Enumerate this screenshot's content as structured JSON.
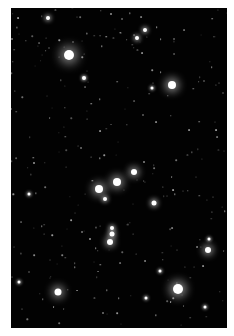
{
  "image": {
    "subject": "star field",
    "frame": {
      "left": 11,
      "top": 8,
      "width": 216,
      "height": 320,
      "background": "#020202",
      "border": "#ffffff"
    },
    "bright_stars": [
      {
        "x": 69,
        "y": 55,
        "r": 5,
        "glow": 11
      },
      {
        "x": 172,
        "y": 85,
        "r": 4,
        "glow": 9
      },
      {
        "x": 117,
        "y": 182,
        "r": 4,
        "glow": 8
      },
      {
        "x": 99,
        "y": 189,
        "r": 4,
        "glow": 8
      },
      {
        "x": 134,
        "y": 172,
        "r": 3,
        "glow": 7
      },
      {
        "x": 178,
        "y": 289,
        "r": 5,
        "glow": 10
      },
      {
        "x": 58,
        "y": 292,
        "r": 3.5,
        "glow": 8
      },
      {
        "x": 208,
        "y": 250,
        "r": 3,
        "glow": 7
      },
      {
        "x": 110,
        "y": 242,
        "r": 3,
        "glow": 6
      },
      {
        "x": 112,
        "y": 234,
        "r": 2.5,
        "glow": 5
      },
      {
        "x": 112,
        "y": 228,
        "r": 2,
        "glow": 4
      },
      {
        "x": 154,
        "y": 203,
        "r": 2.5,
        "glow": 5
      },
      {
        "x": 105,
        "y": 199,
        "r": 2,
        "glow": 4
      },
      {
        "x": 48,
        "y": 18,
        "r": 2,
        "glow": 4
      },
      {
        "x": 137,
        "y": 38,
        "r": 2,
        "glow": 4
      },
      {
        "x": 145,
        "y": 30,
        "r": 2,
        "glow": 4
      },
      {
        "x": 84,
        "y": 78,
        "r": 2,
        "glow": 3
      },
      {
        "x": 152,
        "y": 88,
        "r": 1.5,
        "glow": 3
      },
      {
        "x": 205,
        "y": 307,
        "r": 1.5,
        "glow": 3
      },
      {
        "x": 146,
        "y": 298,
        "r": 1.5,
        "glow": 3
      },
      {
        "x": 29,
        "y": 194,
        "r": 1.5,
        "glow": 3
      },
      {
        "x": 160,
        "y": 271,
        "r": 1.5,
        "glow": 3
      },
      {
        "x": 209,
        "y": 239,
        "r": 1.5,
        "glow": 3
      },
      {
        "x": 19,
        "y": 282,
        "r": 1.5,
        "glow": 3
      }
    ]
  }
}
